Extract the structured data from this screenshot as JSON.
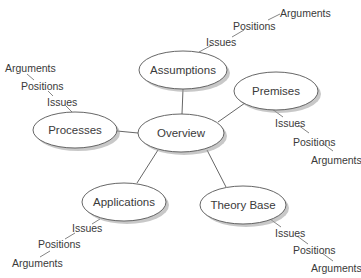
{
  "diagram": {
    "center": {
      "label": "Overview"
    },
    "nodes": [
      {
        "id": "assumptions",
        "label": "Assumptions"
      },
      {
        "id": "premises",
        "label": "Premises"
      },
      {
        "id": "processes",
        "label": "Processes"
      },
      {
        "id": "applications",
        "label": "Applications"
      },
      {
        "id": "theory_base",
        "label": "Theory Base"
      }
    ],
    "chains": {
      "assumptions": {
        "issues": "Issues",
        "positions": "Positions",
        "arguments": "Arguments"
      },
      "premises": {
        "issues": "Issues",
        "positions": "Positions",
        "arguments": "Arguments"
      },
      "processes": {
        "issues": "Issues",
        "positions": "Positions",
        "arguments": "Arguments"
      },
      "applications": {
        "issues": "Issues",
        "positions": "Positions",
        "arguments": "Arguments"
      },
      "theory_base": {
        "issues": "Issues",
        "positions": "Positions",
        "arguments": "Arguments"
      }
    },
    "colors": {
      "stroke": "#555555",
      "text": "#3a3a3a",
      "shadow": "#9a9a9a",
      "fill": "#ffffff"
    }
  }
}
